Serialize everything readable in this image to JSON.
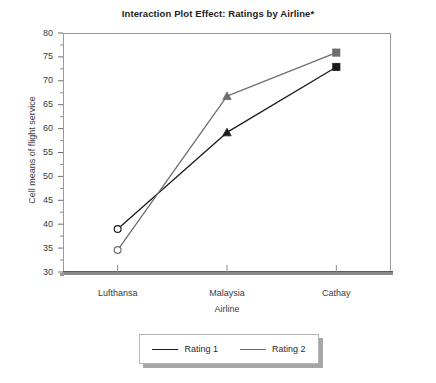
{
  "chart_data": {
    "type": "line",
    "title": "Interaction Plot Effect: Ratings by Airline*",
    "xlabel": "Airline",
    "ylabel": "Cell means of flight service",
    "categories": [
      "Lufthansa",
      "Malaysia",
      "Cathay"
    ],
    "ylim": [
      30,
      80
    ],
    "ytick_labels": [
      "30",
      "35",
      "40",
      "45",
      "50",
      "55",
      "60",
      "65",
      "70",
      "75",
      "80"
    ],
    "ytick_values": [
      30,
      35,
      40,
      45,
      50,
      55,
      60,
      65,
      70,
      75,
      80
    ],
    "ytick_step": 5,
    "minor_ticks": true,
    "grid": false,
    "legend_position": "below-center",
    "series": [
      {
        "name": "Rating 1",
        "color": "#1a1a1a",
        "values": [
          39.0,
          59.2,
          72.9
        ],
        "markers": [
          "open-circle",
          "filled-triangle",
          "filled-square"
        ]
      },
      {
        "name": "Rating 2",
        "color": "#6e6e6e",
        "values": [
          34.6,
          66.8,
          75.9
        ],
        "markers": [
          "open-circle",
          "filled-triangle",
          "filled-square"
        ]
      }
    ]
  },
  "legend": {
    "entries": [
      {
        "label": "Rating 1",
        "color": "#1a1a1a"
      },
      {
        "label": "Rating 2",
        "color": "#6e6e6e"
      }
    ]
  }
}
